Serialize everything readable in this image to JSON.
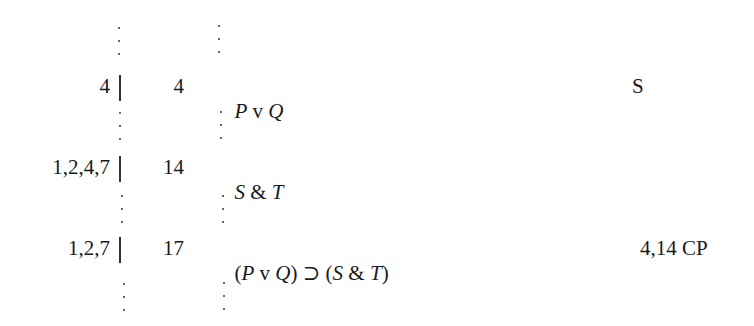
{
  "proof": {
    "lines": [
      {
        "dependencies": "4",
        "line_number": "4",
        "formula_parts": [
          {
            "text": "P",
            "italic": true
          },
          {
            "text": " v ",
            "italic": false
          },
          {
            "text": "Q",
            "italic": true
          }
        ],
        "justification": "S"
      },
      {
        "dependencies": "1,2,4,7",
        "line_number": "14",
        "formula_parts": [
          {
            "text": "S",
            "italic": true
          },
          {
            "text": " & ",
            "italic": false
          },
          {
            "text": "T",
            "italic": true
          }
        ],
        "justification": ""
      },
      {
        "dependencies": "1,2,7",
        "line_number": "17",
        "formula_parts": [
          {
            "text": "(",
            "italic": false
          },
          {
            "text": "P",
            "italic": true
          },
          {
            "text": " v ",
            "italic": false
          },
          {
            "text": "Q",
            "italic": true
          },
          {
            "text": ")",
            "italic": false
          },
          {
            "text": " ⊃ ",
            "italic": false
          },
          {
            "text": "(",
            "italic": false
          },
          {
            "text": "S",
            "italic": true
          },
          {
            "text": " & ",
            "italic": false
          },
          {
            "text": "T",
            "italic": true
          },
          {
            "text": ")",
            "italic": false
          }
        ],
        "justification": "4,14 CP"
      }
    ],
    "ellipsis_glyph": "⋮"
  }
}
